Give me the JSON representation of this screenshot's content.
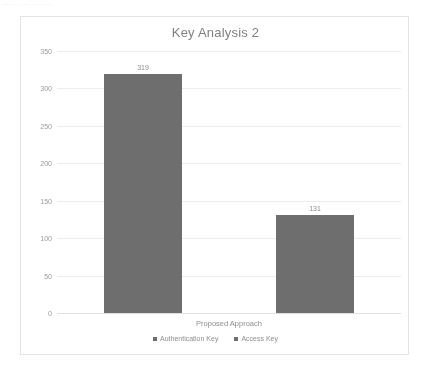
{
  "page": {
    "scan_artifact_text": "........ .. ..... ...... .....",
    "background_color": "#ffffff"
  },
  "chart_data": {
    "type": "bar",
    "title": "Key Analysis 2",
    "xlabel": "",
    "ylabel": "",
    "categories": [
      "Proposed Approach"
    ],
    "series": [
      {
        "name": "Authentication Key",
        "values": [
          319
        ],
        "color": "#6e6e6e"
      },
      {
        "name": "Access Key",
        "values": [
          131
        ],
        "color": "#6e6e6e"
      }
    ],
    "data_labels": [
      "319",
      "131"
    ],
    "ylim": [
      0,
      350
    ],
    "yticks": [
      0,
      50,
      100,
      150,
      200,
      250,
      300,
      350
    ],
    "ytick_labels": [
      "0",
      "50",
      "100",
      "150",
      "200",
      "250",
      "300",
      "350"
    ],
    "grid": true,
    "grid_color": "#ececec",
    "legend_position": "bottom",
    "frame_color": "#e4e4e4",
    "title_color": "#808080",
    "tick_color": "#9a9a9a"
  }
}
